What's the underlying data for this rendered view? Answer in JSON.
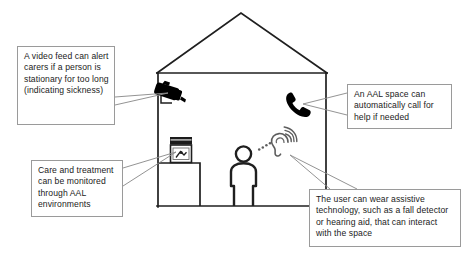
{
  "diagram": {
    "house": {
      "label": "house-cross-section",
      "roof_label": "roof",
      "floor_label": "floor",
      "counter_label": "counter-unit"
    },
    "icons": [
      {
        "id": "cctv-camera",
        "label": "CCTV security camera"
      },
      {
        "id": "telephone",
        "label": "Telephone handset"
      },
      {
        "id": "medicine-bottle",
        "label": "Medicine bottle on counter"
      },
      {
        "id": "person",
        "label": "Person standing"
      },
      {
        "id": "hearing-aid",
        "label": "Ear with hearing aid and sound waves"
      }
    ],
    "callouts": [
      {
        "id": "video-feed",
        "text": "A video feed can alert carers if a person is stationary for too long (indicating sickness)"
      },
      {
        "id": "care-treatment",
        "text": "Care and treatment can be monitored through AAL environments"
      },
      {
        "id": "aal-call",
        "text": "An AAL space can automatically call for help if needed"
      },
      {
        "id": "assistive-tech",
        "text": "The user can wear assistive technology, such as a fall detector or hearing aid, that can interact with the space"
      }
    ],
    "colors": {
      "line": "#1f1f1f",
      "callout_border": "#9a9a9a",
      "text": "#1b1b1b",
      "icon_fill": "#000000",
      "leader": "#8d8d8d",
      "background": "#ffffff"
    }
  }
}
